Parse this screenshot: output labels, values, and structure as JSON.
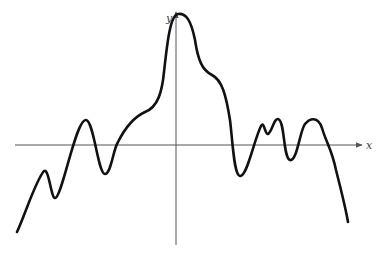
{
  "diagram": {
    "type": "function-graph",
    "axes": {
      "x_label": "x",
      "y_label": "y",
      "x_axis": {
        "x1": 15,
        "y": 145,
        "x2": 362
      },
      "y_axis": {
        "x": 176,
        "y1": 245,
        "y2": 12
      },
      "color": "#555555"
    },
    "curve": {
      "color": "#111111",
      "stroke_width": 2.6,
      "description": "Continuous wavy curve with a global maximum on the y-axis, several local maxima and minima, descending to the lower right",
      "path": "M17,232 C26,212 36,180 44,171 C49,168 51,198 55,198 C62,198 76,118 86,120 C94,121 98,174 105,174 C111,174 113,150 118,142 C124,130 132,118 145,112 C158,107 162,92 164,72 C167,45 170,15 178,14 C186,13 191,20 195,40 C198,60 202,70 212,75 C222,80 226,95 230,120 C233,145 234,175 240,176 C247,177 254,140 261,126 C264,120 265,135 268,134 C272,132 274,118 278,119 C285,120 283,158 290,160 C297,162 300,130 305,124 C310,118 318,116 322,128 C326,142 332,150 336,170 C341,190 345,205 348,222"
    },
    "labels_pos": {
      "y_label": {
        "x": 166,
        "y": 22
      },
      "x_label": {
        "x": 366,
        "y": 148
      }
    }
  }
}
